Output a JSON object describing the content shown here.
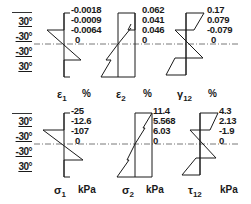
{
  "ply_layup": {
    "top_row": [
      "30°",
      "-30°",
      "-30°",
      "30°"
    ],
    "bottom_row": [
      "30°",
      "-30°",
      "-30°",
      "30°"
    ]
  },
  "panels": [
    {
      "id": "eps1",
      "symbol": "ε",
      "sub": "1",
      "unit": "%",
      "values": [
        "-0.0018",
        "-0.0009",
        "-0.0064",
        "0"
      ]
    },
    {
      "id": "eps2",
      "symbol": "ε",
      "sub": "2",
      "unit": "%",
      "values": [
        "0.062",
        "0.041",
        "0.046",
        "0"
      ]
    },
    {
      "id": "gam12",
      "symbol": "γ",
      "sub": "12",
      "unit": "%",
      "values": [
        "0.17",
        "0.079",
        "-0.079",
        "0"
      ]
    },
    {
      "id": "sig1",
      "symbol": "σ",
      "sub": "1",
      "unit": "kPa",
      "values": [
        "-25",
        "-12.6",
        "-107",
        "0"
      ]
    },
    {
      "id": "sig2",
      "symbol": "σ",
      "sub": "2",
      "unit": "kPa",
      "values": [
        "11.4",
        "5.568",
        "6.03",
        "0"
      ]
    },
    {
      "id": "tau12",
      "symbol": "τ",
      "sub": "12",
      "unit": "kPa",
      "values": [
        "4.3",
        "2.13",
        "-1.9",
        "0"
      ]
    }
  ],
  "colors": {
    "line": "#1a1a1a",
    "centerline": "#555555"
  }
}
